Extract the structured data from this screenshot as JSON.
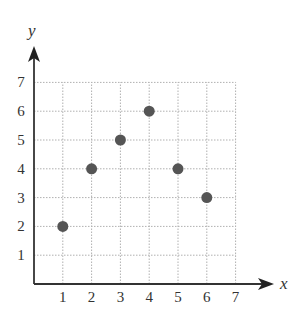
{
  "chart_data": {
    "type": "scatter",
    "title": "",
    "xlabel": "x",
    "ylabel": "y",
    "xlim": [
      0,
      7
    ],
    "ylim": [
      0,
      7
    ],
    "x_ticks": [
      "1",
      "2",
      "3",
      "4",
      "5",
      "6",
      "7"
    ],
    "y_ticks": [
      "1",
      "2",
      "3",
      "4",
      "5",
      "6",
      "7"
    ],
    "grid": true,
    "grid_style": "dotted",
    "legend": null,
    "points": [
      {
        "x": 1,
        "y": 2
      },
      {
        "x": 2,
        "y": 4
      },
      {
        "x": 3,
        "y": 5
      },
      {
        "x": 4,
        "y": 6
      },
      {
        "x": 5,
        "y": 4
      },
      {
        "x": 6,
        "y": 3
      }
    ],
    "x": [
      1,
      2,
      3,
      4,
      5,
      6
    ],
    "y": [
      2,
      4,
      5,
      6,
      4,
      3
    ]
  },
  "colors": {
    "axis": "#333333",
    "grid": "#b0b0b0",
    "point": "#555555",
    "text": "#333333"
  }
}
